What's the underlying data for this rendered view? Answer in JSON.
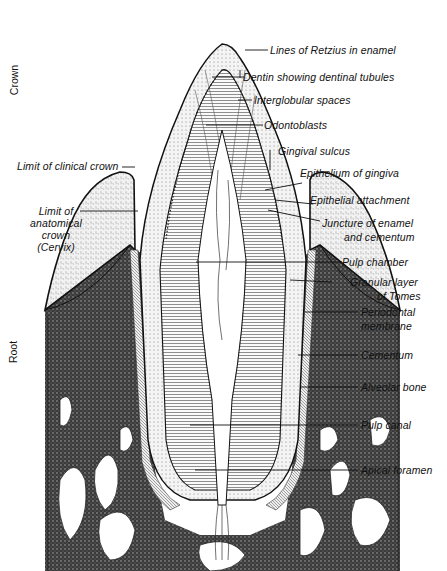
{
  "figure": {
    "side_labels": {
      "crown": "Crown",
      "root": "Root"
    },
    "labels_left": {
      "limit_clinical_crown": "Limit of clinical crown",
      "limit_anatomical_1": "Limit of",
      "limit_anatomical_2": "anatomical",
      "limit_anatomical_3": "crown",
      "limit_anatomical_4": "(Cervix)"
    },
    "labels_right": {
      "retzius": "Lines of Retzius in enamel",
      "dentin": "Dentin showing dentinal tubules",
      "interglobular": "Interglobular spaces",
      "odontoblasts": "Odontoblasts",
      "gingival_sulcus": "Gingival sulcus",
      "epithelium_gingiva": "Epithelium of gingiva",
      "epithelial_attachment": "Epithelial attachment",
      "juncture_1": "Juncture of enamel",
      "juncture_2": "and cementum",
      "pulp_chamber": "Pulp chamber",
      "granular_1": "Granular layer",
      "granular_2": "of Tomes",
      "periodontal_1": "Periodontal",
      "periodontal_2": "membrane",
      "cementum": "Cementum",
      "alveolar_bone": "Alveolar bone",
      "pulp_canal": "Pulp canal",
      "apical_foramen": "Apical foramen"
    },
    "colors": {
      "ink": "#111111",
      "paper": "#ffffff",
      "bone": "#2a2a2a",
      "gum": "#e8e8e8"
    }
  }
}
